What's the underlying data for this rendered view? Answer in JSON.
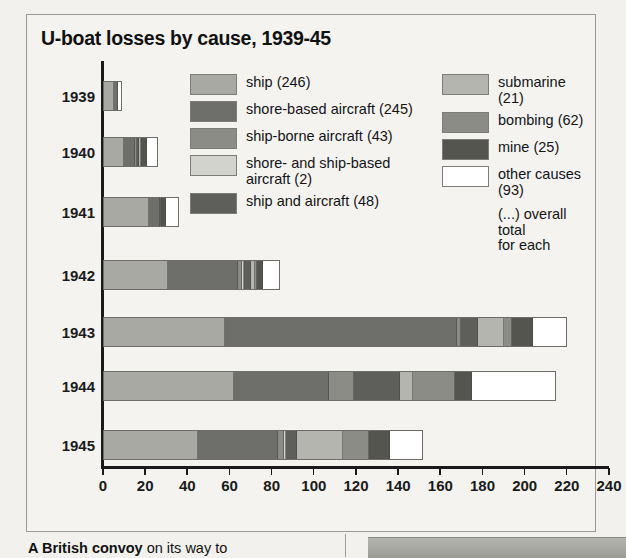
{
  "chart": {
    "title": "U-boat losses by cause, 1939-45",
    "note": "(...) overall total\nfor each"
  },
  "footer": {
    "caption_bold": "A British convoy",
    "caption_rest": " on its way to"
  },
  "chart_data": {
    "type": "bar",
    "orientation": "horizontal",
    "stacked": true,
    "title": "U-boat losses by cause, 1939-45",
    "xlabel": "",
    "ylabel": "",
    "xlim": [
      0,
      240
    ],
    "xticks": [
      0,
      20,
      40,
      60,
      80,
      100,
      120,
      140,
      160,
      180,
      200,
      220,
      240
    ],
    "grid": false,
    "legend_position": "top-right-inside",
    "categories": [
      "1939",
      "1940",
      "1941",
      "1942",
      "1943",
      "1944",
      "1945"
    ],
    "series": [
      {
        "name": "ship",
        "label": "ship (246)",
        "total": 246,
        "color": "#a9a9a3",
        "values": [
          5,
          10,
          22,
          31,
          58,
          62,
          45
        ]
      },
      {
        "name": "shore-based aircraft",
        "label": "shore-based aircraft (245)",
        "total": 245,
        "color": "#6e6e6a",
        "values": [
          2,
          5,
          5,
          33,
          110,
          45,
          38
        ]
      },
      {
        "name": "ship-borne aircraft",
        "label": "ship-borne aircraft (43)",
        "total": 43,
        "color": "#8c8c86",
        "values": [
          0,
          1,
          0,
          2,
          2,
          12,
          3
        ]
      },
      {
        "name": "shore- and ship-based aircraft",
        "label": "shore- and ship-based\naircraft (2)",
        "total": 2,
        "color": "#d3d3cd",
        "values": [
          0,
          0,
          0,
          1,
          0,
          0,
          1
        ]
      },
      {
        "name": "ship and aircraft",
        "label": "ship and aircraft (48)",
        "total": 48,
        "color": "#5e5e5a",
        "values": [
          0,
          1,
          1,
          3,
          8,
          22,
          5
        ]
      },
      {
        "name": "submarine",
        "label": "submarine (21)",
        "total": 21,
        "color": "#b5b5af",
        "values": [
          0,
          1,
          0,
          2,
          12,
          6,
          22
        ]
      },
      {
        "name": "bombing",
        "label": "bombing (62)",
        "total": 62,
        "color": "#8c8c86",
        "values": [
          0,
          0,
          0,
          1,
          4,
          20,
          12
        ]
      },
      {
        "name": "mine",
        "label": "mine (25)",
        "total": 25,
        "color": "#55554f",
        "values": [
          0,
          3,
          2,
          3,
          10,
          8,
          10
        ]
      },
      {
        "name": "other causes",
        "label": "other causes (93)",
        "total": 93,
        "color": "#ffffff",
        "values": [
          2,
          5,
          6,
          8,
          16,
          40,
          16
        ]
      }
    ],
    "totals": [
      9,
      26,
      36,
      84,
      220,
      215,
      152
    ]
  },
  "legend": {
    "left_column": [
      {
        "label": "ship (246)",
        "color": "#a9a9a3",
        "icon": "legend-swatch"
      },
      {
        "label": "shore-based aircraft (245)",
        "color": "#6e6e6a",
        "icon": "legend-swatch"
      },
      {
        "label": "ship-borne aircraft (43)",
        "color": "#8c8c86",
        "icon": "legend-swatch"
      },
      {
        "label": "shore- and ship-based\naircraft (2)",
        "color": "#d3d3cd",
        "icon": "legend-swatch"
      },
      {
        "label": "ship and aircraft (48)",
        "color": "#5e5e5a",
        "icon": "legend-swatch"
      }
    ],
    "right_column": [
      {
        "label": "submarine (21)",
        "color": "#b5b5af",
        "icon": "legend-swatch"
      },
      {
        "label": "bombing (62)",
        "color": "#8c8c86",
        "icon": "legend-swatch"
      },
      {
        "label": "mine (25)",
        "color": "#55554f",
        "icon": "legend-swatch"
      },
      {
        "label": "other causes (93)",
        "color": "#ffffff",
        "icon": "legend-swatch"
      }
    ]
  }
}
